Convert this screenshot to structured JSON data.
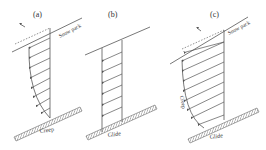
{
  "figure": {
    "panels": [
      {
        "id": "a",
        "label": "(a)",
        "snowpack_label": "Snow pack",
        "ground_label": "Creep",
        "velocity_symbol": "u"
      },
      {
        "id": "b",
        "label": "(b)",
        "ground_label": "Glide"
      },
      {
        "id": "c",
        "label": "(c)",
        "snowpack_label": "Snow pack",
        "profile_label": "Creep",
        "ground_label": "Glide",
        "velocity_symbol": "u"
      }
    ],
    "colors": {
      "line": "#555555",
      "hatch": "#777777",
      "text": "#333333",
      "background": "#ffffff"
    }
  }
}
